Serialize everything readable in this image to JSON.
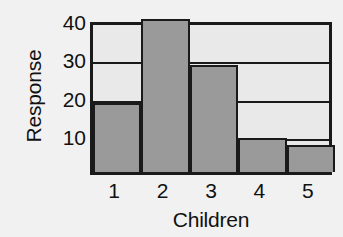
{
  "chart_data": {
    "type": "bar",
    "title": "",
    "xlabel": "Children",
    "ylabel": "Response",
    "categories": [
      "1",
      "2",
      "3",
      "4",
      "5"
    ],
    "values": [
      18,
      40,
      28,
      9,
      7
    ],
    "ylim": [
      0,
      40
    ],
    "yticks": [
      10,
      20,
      30,
      40
    ],
    "ytick_labels": [
      "10",
      "20",
      "30",
      "40"
    ],
    "gridlines": [
      10,
      20,
      30
    ],
    "grid": true,
    "legend": null,
    "colors": {
      "bar_fill": "#9a9a9a",
      "bar_edge": "#1a1a1a",
      "plot_background": "#e9e9e9",
      "figure_background": "#f1f1f1",
      "axis": "#1a1a1a",
      "text": "#111111"
    }
  }
}
